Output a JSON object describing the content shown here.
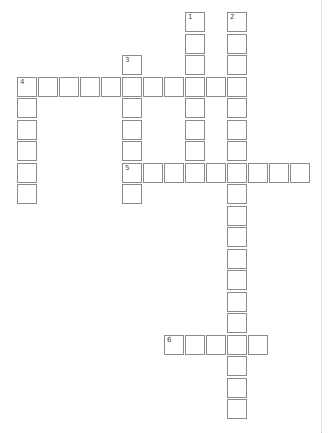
{
  "puzzle": {
    "type": "crossword",
    "grid": {
      "origin_x": 17,
      "origin_y": 12,
      "col_pitch": 21,
      "row_pitch": 21.5,
      "cell_size": 20,
      "border_color": "#8a8a8a"
    },
    "entries": [
      {
        "number": "1",
        "direction": "down",
        "row": 0,
        "col": 8,
        "length": 8
      },
      {
        "number": "2",
        "direction": "down",
        "row": 0,
        "col": 10,
        "length": 19
      },
      {
        "number": "3",
        "direction": "down",
        "row": 2,
        "col": 5,
        "length": 7
      },
      {
        "number": "4",
        "direction": "across",
        "row": 3,
        "col": 0,
        "length": 11
      },
      {
        "number": "4",
        "direction": "down",
        "row": 3,
        "col": 0,
        "length": 6
      },
      {
        "number": "5",
        "direction": "across",
        "row": 7,
        "col": 5,
        "length": 9
      },
      {
        "number": "6",
        "direction": "across",
        "row": 15,
        "col": 7,
        "length": 5
      }
    ]
  }
}
